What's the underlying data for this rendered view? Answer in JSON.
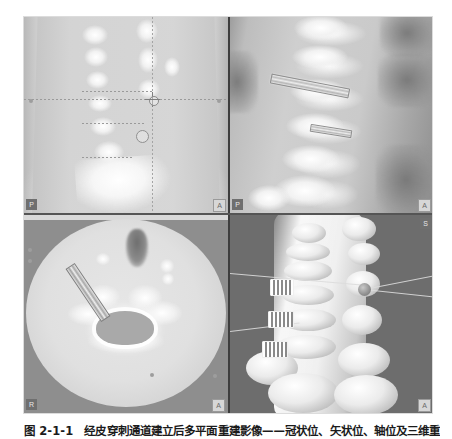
{
  "figure": {
    "caption_label": "图 2-1-1",
    "caption_body": "经皮穿刺通道建立后多平面重建影像——冠状位、矢状位、轴位及三维重建",
    "caption_full": "图 2-1-1　经皮穿刺通道建立后多平面重建影像——冠状位、矢状位、轴位及三维重建",
    "panel_count": 4
  },
  "viewer": {
    "background_color": "#8d8d8d",
    "divider_color": "#3d3d3d",
    "panels": [
      {
        "id": "coronal",
        "position": "top-left",
        "view_label": "Coronal",
        "corner_badges": [
          {
            "text": "P",
            "corner": "bottom-left",
            "style": "dark"
          },
          {
            "text": "A",
            "corner": "bottom-right",
            "style": "light"
          }
        ],
        "overlays": {
          "crosshair_label": "crosshair-target",
          "reference_lines": 4,
          "marker_rings": 1,
          "edge_ticks": 2
        }
      },
      {
        "id": "sagittal",
        "position": "top-right",
        "view_label": "Sagittal",
        "corner_badges": [
          {
            "text": "P",
            "corner": "bottom-left",
            "style": "dark"
          },
          {
            "text": "A",
            "corner": "bottom-right",
            "style": "light"
          }
        ],
        "overlays": {
          "instrument_count": 2,
          "instrument_label": "screw-trajectory"
        }
      },
      {
        "id": "axial",
        "position": "bottom-left",
        "view_label": "Axial",
        "corner_badges": [
          {
            "text": "R",
            "corner": "bottom-left",
            "style": "dark"
          },
          {
            "text": "A",
            "corner": "bottom-right",
            "style": "light"
          }
        ],
        "overlays": {
          "instrument_count": 1,
          "instrument_label": "needle-trajectory"
        }
      },
      {
        "id": "volume-3d",
        "position": "bottom-right",
        "view_label": "3D",
        "corner_badges": [
          {
            "text": "S",
            "corner": "top-right",
            "style": "dark"
          },
          {
            "text": "A",
            "corner": "bottom-right",
            "style": "light"
          }
        ],
        "overlays": {
          "cannula_count": 3,
          "guide_lines": 4,
          "node_marker": 1,
          "background_color": "#6d6d6d"
        }
      }
    ]
  }
}
